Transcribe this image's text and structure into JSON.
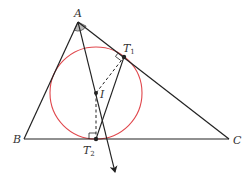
{
  "diagram": {
    "colors": {
      "line": "#222222",
      "circle": "#e0474c",
      "angle_fill": "#bbbbbb",
      "label": "#333333"
    },
    "points": {
      "A": {
        "label": "A",
        "x": 78,
        "y": 22
      },
      "B": {
        "label": "B",
        "x": 24,
        "y": 139
      },
      "C": {
        "label": "C",
        "x": 229,
        "y": 139
      },
      "I": {
        "label": "I",
        "x": 96,
        "y": 93
      },
      "T1": {
        "label": "T",
        "sub": "1",
        "x": 124,
        "y": 57
      },
      "T2": {
        "label": "T",
        "sub": "2",
        "x": 96,
        "y": 139
      }
    },
    "circle": {
      "center": "I",
      "radius": 46
    },
    "segments": [
      {
        "from": "A",
        "to": "B",
        "style": "solid"
      },
      {
        "from": "A",
        "to": "C",
        "style": "solid"
      },
      {
        "from": "B",
        "to": "C",
        "style": "solid"
      },
      {
        "from": "T1",
        "to": "T2",
        "style": "solid"
      },
      {
        "from": "I",
        "to": "T1",
        "style": "dashed"
      },
      {
        "from": "I",
        "to": "T2",
        "style": "dashed"
      }
    ],
    "ray": {
      "from": "A",
      "through": "I",
      "end": {
        "x": 115,
        "y": 172
      },
      "arrow": true
    },
    "right_angle_marks": [
      "T1",
      "T2"
    ],
    "angle_mark": {
      "at": "A",
      "filled": true
    }
  }
}
